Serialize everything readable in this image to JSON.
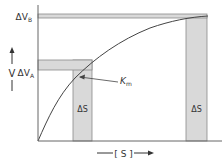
{
  "diagram": {
    "y_axis": {
      "label": "V",
      "arrow": "up"
    },
    "x_axis": {
      "label": "[ S ]",
      "arrow": "right"
    },
    "bands": {
      "delta_vb": {
        "label": "ΔV",
        "sub": "B"
      },
      "delta_va": {
        "label": "ΔV",
        "sub": "A"
      },
      "delta_s_left": {
        "label": "ΔS"
      },
      "delta_s_right": {
        "label": "ΔS"
      }
    },
    "annotation": {
      "label": "K",
      "sub": "m"
    },
    "colors": {
      "band_fill": "#d9d9d9",
      "band_stroke": "#8a8a8a",
      "axis": "#666666",
      "curve": "#444444",
      "text": "#333333"
    }
  }
}
